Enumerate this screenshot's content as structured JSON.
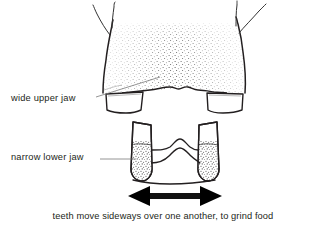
{
  "figure": {
    "type": "anatomical-line-drawing",
    "background_color": "#ffffff",
    "ink_color": "#231f20",
    "stipple_color": "#4a4a4a",
    "leader_line_color": "#6b6b6b"
  },
  "labels": {
    "upper_jaw": "wide upper jaw",
    "lower_jaw": "narrow lower jaw"
  },
  "caption": {
    "text": "teeth move sideways over one another, to grind food"
  },
  "arrow": {
    "name": "double-headed-horizontal-arrow",
    "direction": "both",
    "color": "#111111",
    "x_start": 128,
    "x_end": 222,
    "y": 196
  },
  "leaders": [
    {
      "name": "leader-upper-jaw",
      "from_x": 96,
      "from_y": 97,
      "to_x": 158,
      "to_y": 77
    },
    {
      "name": "leader-lower-jaw",
      "from_x": 100,
      "from_y": 159,
      "to_x": 136,
      "to_y": 159
    }
  ],
  "anatomy": {
    "upper_jaw_label": "upper jaw (maxilla) with stippled shading",
    "upper_teeth": [
      "upper-left-molar",
      "upper-right-molar"
    ],
    "lower_jaw_label": "lower jaw (mandible) with wavy occlusal surface",
    "lower_teeth": [
      "lower-left-molar",
      "lower-right-molar"
    ],
    "left_branch": "left zygomatic / nasal branch",
    "right_branch": "right zygomatic / nasal branch"
  }
}
